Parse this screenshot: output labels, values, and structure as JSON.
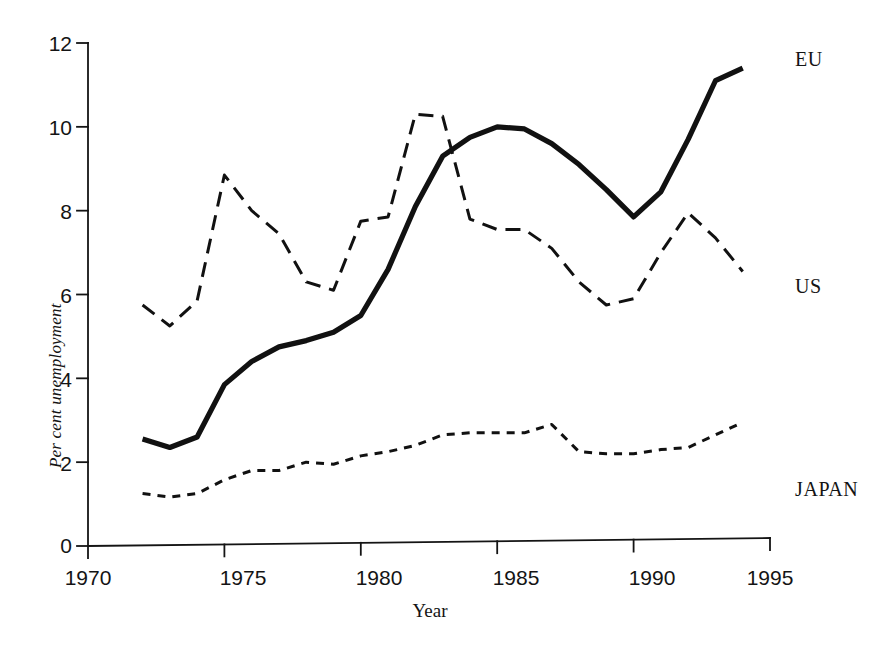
{
  "chart_data": {
    "type": "line",
    "title": "",
    "xlabel": "Year",
    "ylabel": "Per cent unemployment",
    "xlim": [
      1970,
      1995
    ],
    "ylim": [
      0,
      12
    ],
    "xticks": [
      1970,
      1975,
      1980,
      1985,
      1990,
      1995
    ],
    "yticks": [
      0,
      2,
      4,
      6,
      8,
      10,
      12
    ],
    "grid": false,
    "legend_position": "right-inline-labels",
    "x": [
      1972,
      1973,
      1974,
      1975,
      1976,
      1977,
      1978,
      1979,
      1980,
      1981,
      1982,
      1983,
      1984,
      1985,
      1986,
      1987,
      1988,
      1989,
      1990,
      1991,
      1992,
      1993,
      1994
    ],
    "series": [
      {
        "name": "EU",
        "style": "solid-thick",
        "color": "#111111",
        "label_value": "EU",
        "values": [
          2.55,
          2.35,
          2.6,
          3.85,
          4.4,
          4.75,
          4.9,
          5.1,
          5.5,
          6.6,
          8.1,
          9.3,
          9.75,
          10.0,
          9.95,
          9.6,
          9.1,
          8.5,
          7.85,
          8.45,
          9.7,
          11.1,
          11.4
        ]
      },
      {
        "name": "US",
        "style": "dashed-long",
        "color": "#111111",
        "label_value": "US",
        "values": [
          5.75,
          5.25,
          5.85,
          8.85,
          8.0,
          7.45,
          6.3,
          6.1,
          7.75,
          7.85,
          10.3,
          10.25,
          7.8,
          7.55,
          7.55,
          7.1,
          6.3,
          5.75,
          5.9,
          7.0,
          7.95,
          7.35,
          6.55
        ]
      },
      {
        "name": "JAPAN",
        "style": "dashed-short",
        "color": "#111111",
        "label_value": "JAPAN",
        "values": [
          1.25,
          1.17,
          1.25,
          1.58,
          1.8,
          1.8,
          2.0,
          1.95,
          2.15,
          2.25,
          2.4,
          2.65,
          2.7,
          2.7,
          2.7,
          2.9,
          2.25,
          2.2,
          2.2,
          2.3,
          2.35,
          2.65,
          2.95
        ]
      }
    ],
    "series_labels": [
      {
        "text": "EU",
        "x": 795,
        "y": 48
      },
      {
        "text": "US",
        "x": 795,
        "y": 275
      },
      {
        "text": "JAPAN",
        "x": 795,
        "y": 478
      }
    ],
    "xtick_labels": [
      "1970",
      "1975",
      "1980",
      "1985",
      "1990",
      "1995"
    ],
    "ytick_labels": [
      "0",
      "2",
      "4",
      "6",
      "8",
      "10",
      "12"
    ]
  },
  "axes": {
    "x_title": "Year",
    "y_title": "Per cent unemployment"
  }
}
